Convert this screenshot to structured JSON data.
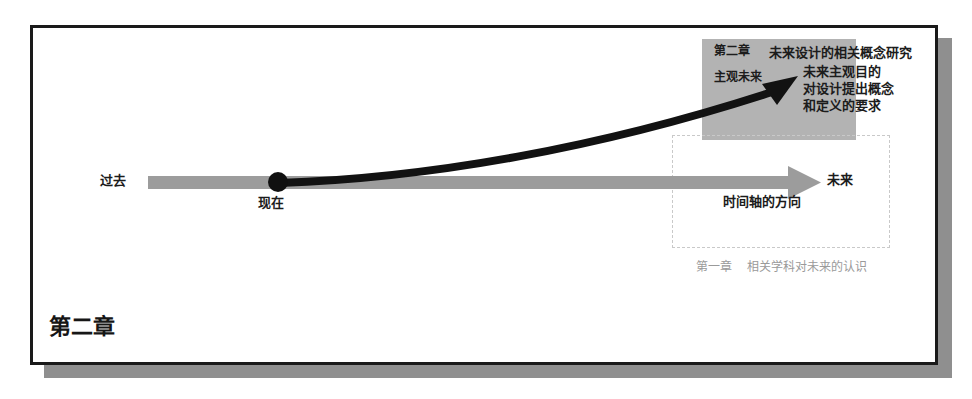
{
  "figure": {
    "title_label": "第二章",
    "colors": {
      "frame_border": "#1a1a1a",
      "frame_shadow": "#8f8f8f",
      "highlight_box": "#b3b3b3",
      "timeline_bar": "#9c9c9c",
      "curve_arrow": "#121212",
      "dashed_box": "#c9c9c9",
      "caption_text": "#9a9a9a"
    }
  },
  "highlight_block": {
    "chapter_tag": "第二章",
    "subjective_future": "主观未来",
    "study_title": "未来设计的相关概念研究",
    "study_lines": "未来主观目的\n对设计提出概念\n和定义的要求"
  },
  "timeline": {
    "past_label": "过去",
    "now_label": "现在",
    "future_label": "未来",
    "axis_direction_label": "时间轴的方向"
  },
  "scope_box": {
    "caption": "第一章    相关学科对未来的认识"
  }
}
